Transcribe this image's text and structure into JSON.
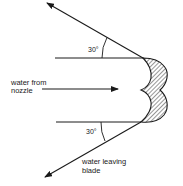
{
  "diagram": {
    "type": "turbine blade water jet deflection",
    "labels": {
      "inlet_line1": "water from",
      "inlet_line2": "nozzle",
      "outlet_line1": "water leaving",
      "outlet_line2": "blade",
      "top_angle": "30°",
      "bottom_angle": "30°"
    },
    "elements": [
      {
        "name": "incoming-jet-arrow",
        "direction": "right"
      },
      {
        "name": "deflected-jet-top-arrow",
        "angle_deg": 30,
        "direction": "up-left"
      },
      {
        "name": "deflected-jet-bottom-arrow",
        "angle_deg": 30,
        "direction": "down-left"
      },
      {
        "name": "blade",
        "shape": "double-cup (hatched)"
      }
    ],
    "colors": {
      "stroke": "#1a1a1a",
      "background": "#ffffff"
    }
  }
}
